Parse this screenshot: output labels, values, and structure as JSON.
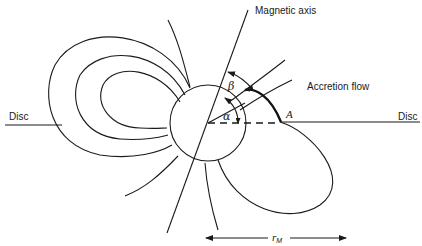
{
  "diagram": {
    "type": "magnetic-accretion-geometry",
    "labels": {
      "magnetic_axis": "Magnetic axis",
      "accretion_flow": "Accretion flow",
      "disc_left": "Disc",
      "disc_right": "Disc",
      "point_a": "A",
      "alpha": "α",
      "beta": "β",
      "radius_symbol": "r",
      "radius_subscript": "M"
    },
    "colors": {
      "stroke": "#1a1a1a",
      "background": "#ffffff"
    }
  }
}
